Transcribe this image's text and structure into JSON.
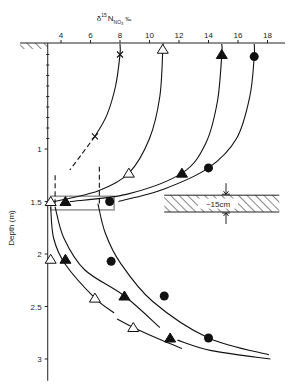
{
  "chart_data": {
    "type": "line",
    "title": "",
    "xlabel": "δ15N NO3 ‰",
    "xlabel_parts": {
      "main": "δ",
      "sup": "15",
      "base": "N",
      "sub": "NO",
      "sub2": "3",
      "unit": "‰"
    },
    "ylabel": "Depth (m)",
    "x_axis_position": "top",
    "y_axis_inverted": true,
    "xlim": [
      3.1,
      19.2
    ],
    "ylim": [
      0,
      3.15
    ],
    "xticks": [
      4,
      6,
      8,
      10,
      12,
      14,
      16,
      18
    ],
    "yticks": [
      {
        "value": 1,
        "label": "1"
      },
      {
        "value": 1.5,
        "label": "1.5"
      },
      {
        "value": 2,
        "label": "2"
      },
      {
        "value": 2.5,
        "label": "2.5"
      },
      {
        "value": 3,
        "label": "3"
      }
    ],
    "y_minor_ticks": [
      0.1,
      0.2,
      0.3,
      0.4,
      0.5,
      0.6,
      0.7,
      0.8,
      0.9
    ],
    "grid": false,
    "legend": null,
    "series": [
      {
        "name": "cross",
        "marker": "x",
        "points": [
          {
            "x": 8.0,
            "depth": 0.1
          },
          {
            "x": 6.3,
            "depth": 0.88
          }
        ],
        "curve_solid": [
          [
            8.0,
            0.0
          ],
          [
            8.0,
            0.1
          ],
          [
            7.7,
            0.4
          ],
          [
            7.1,
            0.68
          ],
          [
            6.3,
            0.88
          ]
        ],
        "curve_dashed": [
          [
            6.3,
            0.88
          ],
          [
            5.4,
            1.05
          ],
          [
            4.6,
            1.2
          ]
        ]
      },
      {
        "name": "open-triangle",
        "marker": "triangle-open",
        "points": [
          {
            "x": 10.9,
            "depth": 0.05
          },
          {
            "x": 8.6,
            "depth": 1.23
          },
          {
            "x": 3.3,
            "depth": 1.5
          },
          {
            "x": 3.3,
            "depth": 2.05
          },
          {
            "x": 6.3,
            "depth": 2.42
          },
          {
            "x": 8.9,
            "depth": 2.7
          }
        ],
        "curve_upper": [
          [
            10.9,
            0.0
          ],
          [
            10.9,
            0.05
          ],
          [
            10.7,
            0.5
          ],
          [
            10.0,
            0.9
          ],
          [
            8.6,
            1.23
          ],
          [
            6.5,
            1.4
          ],
          [
            3.5,
            1.5
          ]
        ],
        "curve_lower": [
          [
            3.3,
            1.55
          ],
          [
            3.5,
            1.85
          ],
          [
            4.3,
            2.1
          ],
          [
            6.3,
            2.42
          ],
          [
            7.6,
            2.56
          ]
        ],
        "curve_tail": [
          [
            7.8,
            2.62
          ],
          [
            8.9,
            2.7
          ],
          [
            10.8,
            2.82
          ],
          [
            12.2,
            2.9
          ]
        ]
      },
      {
        "name": "filled-triangle",
        "marker": "triangle-filled",
        "points": [
          {
            "x": 14.9,
            "depth": 0.1
          },
          {
            "x": 12.2,
            "depth": 1.23
          },
          {
            "x": 4.3,
            "depth": 1.5
          },
          {
            "x": 4.3,
            "depth": 2.05
          },
          {
            "x": 8.3,
            "depth": 2.4
          },
          {
            "x": 11.4,
            "depth": 2.8
          }
        ],
        "curve_upper": [
          [
            14.9,
            0.0
          ],
          [
            14.9,
            0.1
          ],
          [
            14.6,
            0.55
          ],
          [
            13.8,
            0.95
          ],
          [
            12.2,
            1.23
          ],
          [
            8.5,
            1.43
          ],
          [
            4.6,
            1.5
          ]
        ],
        "curve_lower": [
          [
            3.6,
            1.55
          ],
          [
            4.2,
            1.85
          ],
          [
            5.6,
            2.15
          ],
          [
            8.3,
            2.4
          ],
          [
            10.7,
            2.7
          ]
        ],
        "curve_tail": [
          [
            11.9,
            2.82
          ],
          [
            14.2,
            2.92
          ],
          [
            18.2,
            3.0
          ]
        ]
      },
      {
        "name": "filled-circle",
        "marker": "circle-filled",
        "points": [
          {
            "x": 17.1,
            "depth": 0.12
          },
          {
            "x": 14.0,
            "depth": 1.18
          },
          {
            "x": 7.3,
            "depth": 1.5
          },
          {
            "x": 7.4,
            "depth": 2.07
          },
          {
            "x": 11.0,
            "depth": 2.4
          },
          {
            "x": 14.0,
            "depth": 2.8
          }
        ],
        "curve_upper": [
          [
            17.1,
            0.0
          ],
          [
            17.1,
            0.12
          ],
          [
            16.8,
            0.5
          ],
          [
            15.9,
            0.9
          ],
          [
            14.0,
            1.18
          ],
          [
            11.0,
            1.38
          ],
          [
            7.9,
            1.5
          ]
        ],
        "curve_lower": [
          [
            6.5,
            1.52
          ],
          [
            7.0,
            1.8
          ],
          [
            8.0,
            2.08
          ],
          [
            10.2,
            2.45
          ],
          [
            14.0,
            2.8
          ],
          [
            18.1,
            2.96
          ]
        ]
      }
    ],
    "dashed_verticals": [
      {
        "x": 3.6,
        "depth_from": 1.25,
        "depth_to": 1.52
      },
      {
        "x": 6.6,
        "depth_from": 1.17,
        "depth_to": 1.52
      }
    ],
    "highlight_band": {
      "x_from": 3.3,
      "x_to": 7.6,
      "depth_from": 1.45,
      "depth_to": 1.58,
      "color": "#999999"
    },
    "annotations": [
      {
        "type": "hatched-layer",
        "label": "~15 cm",
        "x_from": 11.0,
        "x_to": 18.8,
        "depth_from": 1.44,
        "depth_to": 1.6
      },
      {
        "type": "ground-surface",
        "label": ""
      }
    ]
  },
  "annotation_label": "~15cm",
  "ylabel_text": "Depth (m)"
}
